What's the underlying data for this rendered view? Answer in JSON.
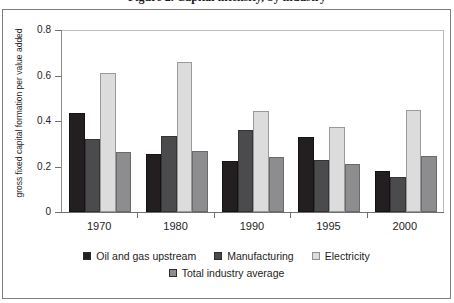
{
  "chart_data": {
    "type": "bar",
    "title": "Figure 2. Capital intensity, by industry",
    "xlabel": "",
    "ylabel": "gross fixed capital formation per value added",
    "categories": [
      "1970",
      "1980",
      "1990",
      "1995",
      "2000"
    ],
    "ylim": [
      0,
      0.8
    ],
    "yticks": [
      "0",
      "0.2",
      "0.4",
      "0.6",
      "0.8"
    ],
    "ytick_values": [
      0,
      0.2,
      0.4,
      0.6,
      0.8
    ],
    "grid": false,
    "legend_position": "bottom",
    "series": [
      {
        "name": "Oil and gas upstream",
        "color": "#231f20",
        "values": [
          0.435,
          0.255,
          0.225,
          0.33,
          0.18
        ]
      },
      {
        "name": "Manufacturing",
        "color": "#4b4b4d",
        "values": [
          0.32,
          0.335,
          0.36,
          0.23,
          0.155
        ]
      },
      {
        "name": "Electricity",
        "color": "#dcdcdc",
        "values": [
          0.61,
          0.66,
          0.445,
          0.375,
          0.45
        ]
      },
      {
        "name": "Total industry average",
        "color": "#8d8d8f",
        "values": [
          0.265,
          0.27,
          0.24,
          0.21,
          0.245
        ]
      }
    ]
  }
}
